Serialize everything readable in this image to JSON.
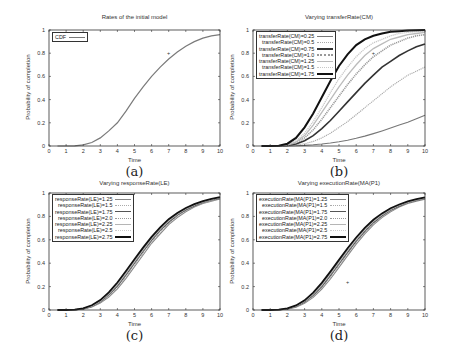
{
  "chart_data": [
    {
      "id": "a",
      "type": "line",
      "title": "Rates of the initial model",
      "xlabel": "Time",
      "ylabel": "Probability of completion",
      "caption": "(a)",
      "xlim": [
        0,
        10
      ],
      "ylim": [
        0,
        1
      ],
      "xticks": [
        0,
        1,
        2,
        3,
        4,
        5,
        6,
        7,
        8,
        9,
        10
      ],
      "yticks": [
        0,
        0.2,
        0.4,
        0.6,
        0.8,
        1
      ],
      "ytick_labels": [
        "0",
        "0.2",
        "0.4",
        "0.6",
        "0.8",
        "1"
      ],
      "grid": false,
      "legend_position": "upper-left",
      "x": [
        0.5,
        1,
        1.5,
        2,
        2.5,
        3,
        3.5,
        4,
        4.5,
        5,
        5.5,
        6,
        6.5,
        7,
        7.5,
        8,
        8.5,
        9,
        9.5,
        10
      ],
      "series": [
        {
          "name": "CDF",
          "color": "#7a7a7a",
          "width": 1.2,
          "values": [
            0,
            0,
            0.002,
            0.01,
            0.03,
            0.07,
            0.13,
            0.2,
            0.3,
            0.41,
            0.51,
            0.6,
            0.68,
            0.75,
            0.81,
            0.86,
            0.9,
            0.93,
            0.95,
            0.96
          ]
        }
      ],
      "annotations": [
        {
          "x": 7,
          "y": 0.8,
          "text": "+"
        }
      ]
    },
    {
      "id": "b",
      "type": "line",
      "title": "Varying transferRate(CM)",
      "xlabel": "Time",
      "ylabel": "Probability of completion",
      "caption": "(b)",
      "xlim": [
        0,
        10
      ],
      "ylim": [
        0,
        1
      ],
      "xticks": [
        0,
        1,
        2,
        3,
        4,
        5,
        6,
        7,
        8,
        9,
        10
      ],
      "yticks": [
        0,
        0.2,
        0.4,
        0.6,
        0.8,
        1
      ],
      "ytick_labels": [
        "0",
        "0.2",
        "0.4",
        "0.6",
        "0.8",
        "1"
      ],
      "grid": false,
      "legend_position": "upper-left",
      "x": [
        0.5,
        1,
        1.5,
        2,
        2.5,
        3,
        3.5,
        4,
        4.5,
        5,
        5.5,
        6,
        6.5,
        7,
        7.5,
        8,
        8.5,
        9,
        9.5,
        10
      ],
      "series": [
        {
          "name": "transferRate(CM)=0.25",
          "color": "#777777",
          "width": 1.1,
          "values": [
            0,
            0,
            0,
            0,
            0.002,
            0.005,
            0.01,
            0.017,
            0.026,
            0.037,
            0.05,
            0.066,
            0.085,
            0.107,
            0.13,
            0.155,
            0.18,
            0.205,
            0.235,
            0.265
          ]
        },
        {
          "name": "transferRate(CM)=0.5",
          "color": "#a8a8a8",
          "width": 1.1,
          "values": [
            0,
            0,
            0,
            0.002,
            0.008,
            0.02,
            0.04,
            0.07,
            0.11,
            0.16,
            0.21,
            0.27,
            0.33,
            0.39,
            0.45,
            0.51,
            0.56,
            0.61,
            0.645,
            0.68
          ]
        },
        {
          "name": "transferRate(CM)=0.75",
          "color": "#333333",
          "width": 1.6,
          "values": [
            0,
            0,
            0,
            0.004,
            0.017,
            0.045,
            0.09,
            0.15,
            0.22,
            0.3,
            0.38,
            0.46,
            0.54,
            0.61,
            0.68,
            0.73,
            0.78,
            0.82,
            0.855,
            0.88
          ]
        },
        {
          "name": "transferRate(CM)=1.0",
          "color": "#999999",
          "width": 1.6,
          "values": [
            0,
            0,
            0.001,
            0.006,
            0.028,
            0.07,
            0.14,
            0.23,
            0.33,
            0.43,
            0.53,
            0.62,
            0.7,
            0.77,
            0.82,
            0.87,
            0.9,
            0.93,
            0.95,
            0.96
          ]
        },
        {
          "name": "transferRate(CM)=1.25",
          "color": "#bbbbbb",
          "width": 1.3,
          "values": [
            0,
            0,
            0.001,
            0.008,
            0.035,
            0.09,
            0.18,
            0.29,
            0.4,
            0.51,
            0.61,
            0.7,
            0.78,
            0.84,
            0.88,
            0.92,
            0.94,
            0.96,
            0.97,
            0.98
          ]
        },
        {
          "name": "transferRate(CM)=1.5",
          "color": "#c8c8c8",
          "width": 1.3,
          "values": [
            0,
            0,
            0.002,
            0.012,
            0.045,
            0.11,
            0.21,
            0.33,
            0.46,
            0.58,
            0.68,
            0.77,
            0.84,
            0.89,
            0.92,
            0.95,
            0.97,
            0.98,
            0.985,
            0.99
          ]
        },
        {
          "name": "transferRate(CM)=1.75",
          "color": "#111111",
          "width": 2.0,
          "values": [
            0,
            0,
            0.003,
            0.02,
            0.07,
            0.16,
            0.28,
            0.42,
            0.56,
            0.69,
            0.79,
            0.87,
            0.92,
            0.95,
            0.97,
            0.985,
            0.99,
            0.995,
            0.998,
            1.0
          ]
        }
      ],
      "annotations": [
        {
          "x": 7,
          "y": 0.8,
          "text": "+"
        }
      ]
    },
    {
      "id": "c",
      "type": "line",
      "title": "Varying responseRate(LE)",
      "xlabel": "Time",
      "ylabel": "Probability of completion",
      "caption": "(c)",
      "xlim": [
        0,
        10
      ],
      "ylim": [
        0,
        1
      ],
      "xticks": [
        0,
        1,
        2,
        3,
        4,
        5,
        6,
        7,
        8,
        9,
        10
      ],
      "yticks": [
        0,
        0.2,
        0.4,
        0.6,
        0.8,
        1
      ],
      "ytick_labels": [
        "0",
        "0.2",
        "0.4",
        "0.6",
        "0.8",
        "1"
      ],
      "grid": false,
      "legend_position": "upper-left",
      "x": [
        0.5,
        1,
        1.5,
        2,
        2.5,
        3,
        3.5,
        4,
        4.5,
        5,
        5.5,
        6,
        6.5,
        7,
        7.5,
        8,
        8.5,
        9,
        9.5,
        10
      ],
      "series": [
        {
          "name": "responseRate(LE)=1.25",
          "color": "#888888",
          "width": 1.1,
          "values": [
            0,
            0,
            0.002,
            0.008,
            0.025,
            0.06,
            0.11,
            0.18,
            0.27,
            0.37,
            0.47,
            0.57,
            0.65,
            0.73,
            0.79,
            0.84,
            0.88,
            0.91,
            0.93,
            0.95
          ]
        },
        {
          "name": "responseRate(LE)=1.5",
          "color": "#aaaaaa",
          "width": 1.1,
          "values": [
            0,
            0,
            0.002,
            0.009,
            0.028,
            0.065,
            0.12,
            0.195,
            0.285,
            0.385,
            0.485,
            0.58,
            0.665,
            0.74,
            0.8,
            0.85,
            0.885,
            0.915,
            0.935,
            0.952
          ]
        },
        {
          "name": "responseRate(LE)=1.75",
          "color": "#555555",
          "width": 1.2,
          "values": [
            0,
            0,
            0.002,
            0.01,
            0.031,
            0.07,
            0.13,
            0.205,
            0.3,
            0.4,
            0.5,
            0.595,
            0.68,
            0.75,
            0.81,
            0.855,
            0.89,
            0.92,
            0.94,
            0.955
          ]
        },
        {
          "name": "responseRate(LE)=2.0",
          "color": "#999999",
          "width": 1.2,
          "values": [
            0,
            0,
            0.002,
            0.011,
            0.033,
            0.075,
            0.135,
            0.215,
            0.31,
            0.41,
            0.51,
            0.605,
            0.69,
            0.76,
            0.815,
            0.86,
            0.895,
            0.922,
            0.943,
            0.958
          ]
        },
        {
          "name": "responseRate(LE)=2.25",
          "color": "#b5b5b5",
          "width": 1.2,
          "values": [
            0,
            0,
            0.003,
            0.012,
            0.035,
            0.078,
            0.14,
            0.222,
            0.318,
            0.418,
            0.518,
            0.612,
            0.696,
            0.765,
            0.82,
            0.865,
            0.898,
            0.925,
            0.945,
            0.96
          ]
        },
        {
          "name": "responseRate(LE)=2.5",
          "color": "#cccccc",
          "width": 1.2,
          "values": [
            0,
            0,
            0.003,
            0.013,
            0.037,
            0.081,
            0.145,
            0.228,
            0.325,
            0.425,
            0.525,
            0.618,
            0.7,
            0.77,
            0.825,
            0.868,
            0.9,
            0.927,
            0.947,
            0.962
          ]
        },
        {
          "name": "responseRate(LE)=2.75",
          "color": "#111111",
          "width": 1.8,
          "values": [
            0,
            0,
            0.003,
            0.014,
            0.04,
            0.085,
            0.15,
            0.235,
            0.333,
            0.433,
            0.533,
            0.625,
            0.707,
            0.776,
            0.83,
            0.872,
            0.904,
            0.93,
            0.95,
            0.965
          ]
        }
      ]
    },
    {
      "id": "d",
      "type": "line",
      "title": "Varying executionRate(MA(P1)",
      "xlabel": "Time",
      "ylabel": "Probability of completion",
      "caption": "(d)",
      "xlim": [
        0,
        10
      ],
      "ylim": [
        0,
        1
      ],
      "xticks": [
        0,
        1,
        2,
        3,
        4,
        5,
        6,
        7,
        8,
        9,
        10
      ],
      "yticks": [
        0,
        0.2,
        0.4,
        0.6,
        0.8,
        1
      ],
      "ytick_labels": [
        "0",
        "0.2",
        "0.4",
        "0.6",
        "0.8",
        "1"
      ],
      "grid": false,
      "legend_position": "upper-left",
      "x": [
        0.5,
        1,
        1.5,
        2,
        2.5,
        3,
        3.5,
        4,
        4.5,
        5,
        5.5,
        6,
        6.5,
        7,
        7.5,
        8,
        8.5,
        9,
        9.5,
        10
      ],
      "series": [
        {
          "name": "executionRate(MA(P1)=1.25",
          "color": "#888888",
          "width": 1.1,
          "values": [
            0,
            0,
            0.002,
            0.008,
            0.024,
            0.058,
            0.108,
            0.178,
            0.265,
            0.365,
            0.465,
            0.563,
            0.65,
            0.727,
            0.79,
            0.84,
            0.88,
            0.91,
            0.93,
            0.948
          ]
        },
        {
          "name": "executionRate(MA(P1)=1.5",
          "color": "#aaaaaa",
          "width": 1.1,
          "values": [
            0,
            0,
            0.002,
            0.009,
            0.027,
            0.063,
            0.117,
            0.19,
            0.28,
            0.38,
            0.48,
            0.577,
            0.662,
            0.737,
            0.797,
            0.846,
            0.884,
            0.913,
            0.934,
            0.95
          ]
        },
        {
          "name": "executionRate(MA(P1)=1.75",
          "color": "#555555",
          "width": 1.2,
          "values": [
            0,
            0,
            0.002,
            0.01,
            0.03,
            0.068,
            0.125,
            0.2,
            0.293,
            0.393,
            0.493,
            0.588,
            0.673,
            0.746,
            0.805,
            0.852,
            0.888,
            0.917,
            0.938,
            0.953
          ]
        },
        {
          "name": "executionRate(MA(P1)=2.0",
          "color": "#999999",
          "width": 1.2,
          "values": [
            0,
            0,
            0.002,
            0.011,
            0.032,
            0.072,
            0.132,
            0.21,
            0.304,
            0.404,
            0.504,
            0.598,
            0.682,
            0.754,
            0.811,
            0.857,
            0.892,
            0.92,
            0.94,
            0.955
          ]
        },
        {
          "name": "executionRate(MA(P1)=2.25",
          "color": "#b5b5b5",
          "width": 1.2,
          "values": [
            0,
            0,
            0.003,
            0.012,
            0.034,
            0.076,
            0.138,
            0.218,
            0.313,
            0.413,
            0.513,
            0.606,
            0.689,
            0.76,
            0.816,
            0.861,
            0.895,
            0.922,
            0.942,
            0.957
          ]
        },
        {
          "name": "executionRate(MA(P1)=2.5",
          "color": "#cccccc",
          "width": 1.2,
          "values": [
            0,
            0,
            0.003,
            0.013,
            0.036,
            0.079,
            0.143,
            0.225,
            0.32,
            0.42,
            0.52,
            0.613,
            0.695,
            0.765,
            0.82,
            0.864,
            0.898,
            0.925,
            0.945,
            0.96
          ]
        },
        {
          "name": "executionRate(MA(P1)=2.75",
          "color": "#111111",
          "width": 1.8,
          "values": [
            0,
            0,
            0.003,
            0.014,
            0.039,
            0.083,
            0.148,
            0.232,
            0.328,
            0.428,
            0.528,
            0.62,
            0.702,
            0.771,
            0.826,
            0.869,
            0.902,
            0.928,
            0.948,
            0.963
          ]
        }
      ],
      "annotations": [
        {
          "x": 5.5,
          "y": 0.24,
          "text": "+"
        }
      ]
    }
  ]
}
